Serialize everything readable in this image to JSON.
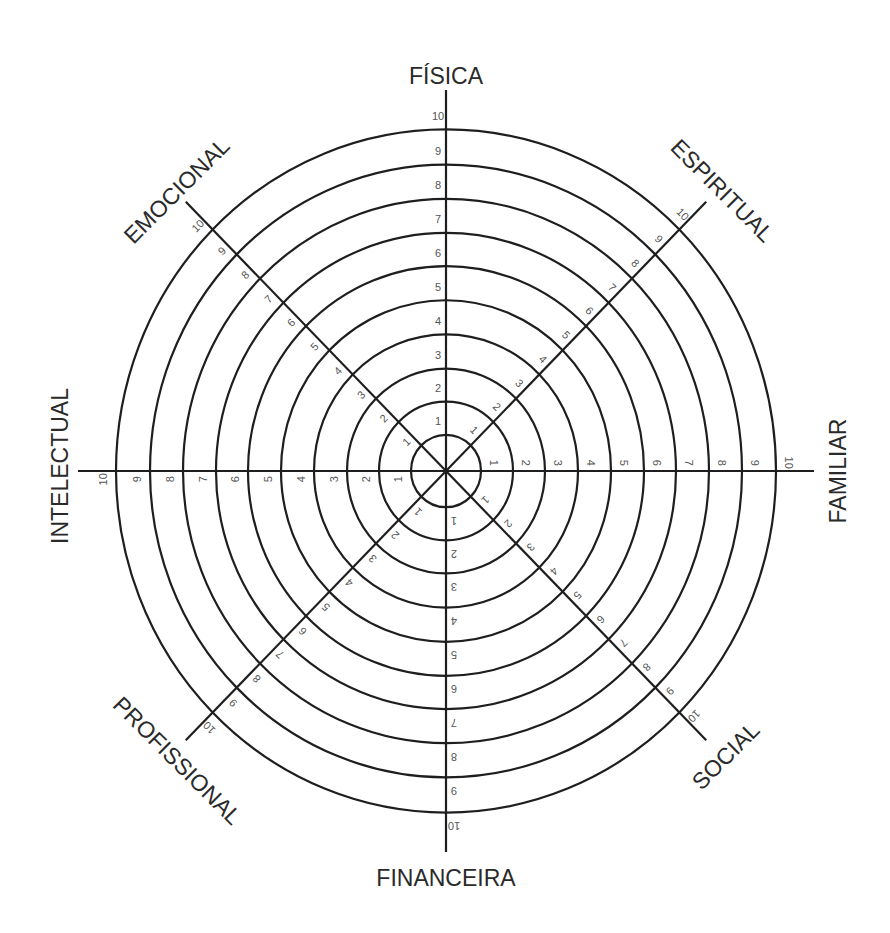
{
  "diagram": {
    "type": "wheel_of_life",
    "center": {
      "x": 446,
      "y": 471
    },
    "scale_max": 10,
    "ring_radii": [
      35,
      67,
      99,
      132,
      165,
      198,
      230,
      263,
      296,
      330
    ],
    "y_stretch": 1.035,
    "axis_extent": 368,
    "colors": {
      "line": "#1e1e1e",
      "numbers": "#555555",
      "labels": "#2a2a2a",
      "background": "#ffffff"
    },
    "scale_labels": [
      "1",
      "2",
      "3",
      "4",
      "5",
      "6",
      "7",
      "8",
      "9",
      "10"
    ],
    "areas": [
      {
        "label": "FÍSICA",
        "angle": 0,
        "label_x": 446,
        "label_y": 78,
        "label_rotate": 0
      },
      {
        "label": "ESPIRITUAL",
        "angle": 45,
        "label_x": 721,
        "label_y": 192,
        "label_rotate": 45
      },
      {
        "label": "FAMILIAR",
        "angle": 90,
        "label_x": 840,
        "label_y": 471,
        "label_rotate": -90
      },
      {
        "label": "SOCIAL",
        "angle": 135,
        "label_x": 727,
        "label_y": 757,
        "label_rotate": -45
      },
      {
        "label": "FINANCEIRA",
        "angle": 180,
        "label_x": 446,
        "label_y": 880,
        "label_rotate": 0
      },
      {
        "label": "PROFISSIONAL",
        "angle": 225,
        "label_x": 176,
        "label_y": 762,
        "label_rotate": 45
      },
      {
        "label": "INTELECTUAL",
        "angle": 270,
        "label_x": 62,
        "label_y": 466,
        "label_rotate": -90
      },
      {
        "label": "EMOCIONAL",
        "angle": 315,
        "label_x": 178,
        "label_y": 192,
        "label_rotate": -45
      }
    ]
  }
}
